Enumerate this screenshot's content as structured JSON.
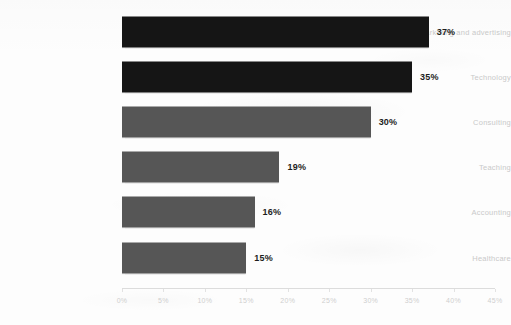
{
  "chart_data": {
    "type": "bar",
    "orientation": "horizontal",
    "title": "",
    "subtitle": "",
    "xlabel": "",
    "ylabel": "",
    "xlim": [
      0,
      45
    ],
    "grid": false,
    "legend": null,
    "categories": [
      "Marketing and advertising",
      "Technology",
      "Consulting",
      "Teaching",
      "Accounting",
      "Healthcare"
    ],
    "values": [
      37,
      35,
      30,
      19,
      16,
      15
    ],
    "data_labels": [
      "37%",
      "35%",
      "30%",
      "19%",
      "16%",
      "15%"
    ],
    "bar_colors": [
      "#151515",
      "#151515",
      "#565656",
      "#565656",
      "#565656",
      "#565656"
    ],
    "xticks": [
      0,
      5,
      10,
      15,
      20,
      25,
      30,
      35,
      40,
      45
    ],
    "xtick_labels": [
      "0%",
      "5%",
      "10%",
      "15%",
      "20%",
      "25%",
      "30%",
      "35%",
      "40%",
      "45%"
    ],
    "colors": {
      "background": "#fdfdfd",
      "bar_dark": "#151515",
      "bar_light": "#565656",
      "category_label": "#c9c9c9",
      "tick_label": "#cfcfcf",
      "axis_line": "#dcdcdc",
      "value_label": "#1d1d1d"
    }
  }
}
